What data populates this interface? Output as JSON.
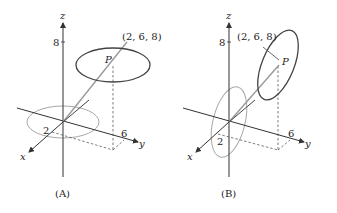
{
  "panels": [
    {
      "id": "A",
      "caption": "(A)",
      "axis_labels": {
        "x": "x",
        "y": "y",
        "z": "z"
      },
      "tick_labels": {
        "z": "8",
        "x": "2",
        "y": "6"
      },
      "point_label": "P",
      "point_coords": "(2, 6, 8)",
      "description": "Horizontal circle centered at P, parallel to xy-plane; gray circle in xy-plane at origin"
    },
    {
      "id": "B",
      "caption": "(B)",
      "axis_labels": {
        "x": "x",
        "y": "y",
        "z": "z"
      },
      "tick_labels": {
        "z": "8",
        "x": "2",
        "y": "6"
      },
      "point_label": "P",
      "point_coords": "(2, 6, 8)",
      "description": "Vertical circle centered at P, parallel to xz-plane; gray circle in xz-plane at origin"
    }
  ],
  "colors": {
    "axis": "#333333",
    "curve": "#444444",
    "gray_curve": "#a8a8a8",
    "vector": "#9a9a9a"
  }
}
